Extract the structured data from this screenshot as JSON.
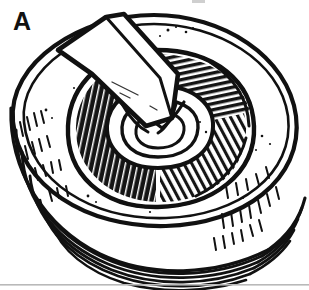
{
  "figure": {
    "panel_label": "A",
    "caption": "",
    "colors": {
      "ink": "#111111",
      "paper": "#ffffff",
      "rule": "#b9b9b9",
      "shadow_fill": "#151515"
    },
    "canvas": {
      "width": 309,
      "height": 290
    },
    "parts": [
      {
        "name": "outer-shell-rim",
        "label": ""
      },
      {
        "name": "thread-arcs",
        "label": ""
      },
      {
        "name": "annular-cavity",
        "label": ""
      },
      {
        "name": "left-shadow-hatch",
        "label": ""
      },
      {
        "name": "right-shadow-hatch",
        "label": ""
      },
      {
        "name": "insulator-nose-rings",
        "label": ""
      },
      {
        "name": "center-electrode",
        "label": ""
      },
      {
        "name": "ground-electrode-bar",
        "label": ""
      },
      {
        "name": "bottom-rule",
        "label": ""
      },
      {
        "name": "top-edge-artifact",
        "label": ""
      }
    ]
  }
}
